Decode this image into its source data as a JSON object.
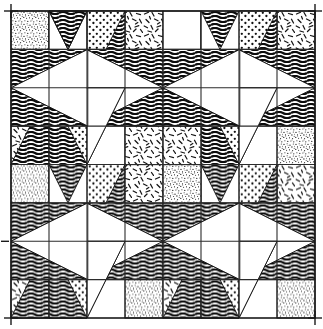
{
  "figure": {
    "type": "quilt-block-diagram",
    "width": 323,
    "height": 329,
    "background_color": "#ffffff",
    "ink_color": "#111111",
    "grid": {
      "columns": 8,
      "rows": 8,
      "cell_width": 38,
      "cell_height": 38.375,
      "origin_x": 11,
      "origin_y": 11,
      "line_color": "#2b2b2b",
      "line_width": 1.1,
      "visible": true
    },
    "border": {
      "color": "#1a1a1a",
      "width": 1.6,
      "visible": true
    },
    "corner_ticks": {
      "label": "registration-crosshair",
      "color": "#1a1a1a",
      "length": 9,
      "positions": [
        "top-left",
        "top-right",
        "bottom-left",
        "bottom-right"
      ]
    },
    "tiling": {
      "block_name": "Dutchman's Puzzle Windmill",
      "block_span_cells": 4,
      "repeats_across": 2,
      "repeats_down": 2,
      "total_blocks": 4
    },
    "textures": [
      {
        "id": "wavy",
        "label": "wavy-horizontal-lines",
        "description": "dense dark wavy horizontal hatching",
        "color": "#101010",
        "density": "high"
      },
      {
        "id": "dots",
        "label": "medium-dots",
        "description": "scattered medium round dots on white",
        "color": "#111111",
        "density": "medium"
      },
      {
        "id": "speckle",
        "label": "fine-speckle",
        "description": "very fine random stipple specks",
        "color": "#1a1a1a",
        "density": "very-high"
      },
      {
        "id": "dashes",
        "label": "random-dashes",
        "description": "short randomly angled dash strokes",
        "color": "#151515",
        "density": "low"
      },
      {
        "id": "plain",
        "label": "plain-white",
        "description": "unfilled white patch",
        "color": "#ffffff",
        "density": "none"
      }
    ],
    "block_layout": {
      "description": "Each 4x4-cell block: a central white on-point square surrounded by four wavy flying-geese wings forming a pinwheel; four dotted or wavy triangles at the edge midpoints; four textured corner squares.",
      "corner_squares": [
        "speckle",
        "dashes",
        "dashes",
        "speckle"
      ],
      "edge_triangles": [
        "dots",
        "wavy",
        "dots",
        "wavy"
      ],
      "pinwheel_wings": "wavy",
      "center": "plain"
    },
    "caption": ""
  }
}
